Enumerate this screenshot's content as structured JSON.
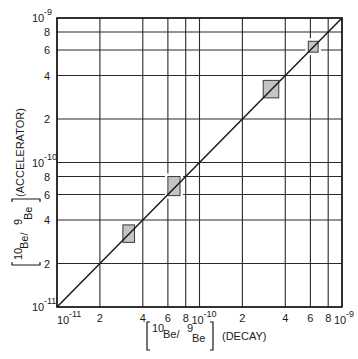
{
  "chart_data": {
    "type": "scatter",
    "title": "",
    "xlabel": "[10Be/9Be] (DECAY)",
    "ylabel": "[10Be/9Be] (ACCELERATOR)",
    "x_scale": "log",
    "y_scale": "log",
    "xlim": [
      1e-11,
      1e-09
    ],
    "ylim": [
      1e-11,
      1e-09
    ],
    "grid": true,
    "legend": null,
    "x_ticks": [
      {
        "value": 1e-11,
        "label": "10",
        "exp": "-11",
        "major": true
      },
      {
        "value": 2e-11,
        "label": "2"
      },
      {
        "value": 4e-11,
        "label": "4"
      },
      {
        "value": 6e-11,
        "label": "6"
      },
      {
        "value": 8e-11,
        "label": "8"
      },
      {
        "value": 1e-10,
        "label": "10",
        "exp": "-10",
        "major": true
      },
      {
        "value": 2e-10,
        "label": "2"
      },
      {
        "value": 4e-10,
        "label": "4"
      },
      {
        "value": 6e-10,
        "label": "6"
      },
      {
        "value": 8e-10,
        "label": "8"
      },
      {
        "value": 1e-09,
        "label": "10",
        "exp": "-9",
        "major": true
      }
    ],
    "y_ticks": [
      {
        "value": 1e-11,
        "label": "10",
        "exp": "-11",
        "major": true
      },
      {
        "value": 2e-11,
        "label": "2"
      },
      {
        "value": 4e-11,
        "label": "4"
      },
      {
        "value": 6e-11,
        "label": "6"
      },
      {
        "value": 8e-11,
        "label": "8"
      },
      {
        "value": 1e-10,
        "label": "10",
        "exp": "-10",
        "major": true
      },
      {
        "value": 2e-10,
        "label": "2"
      },
      {
        "value": 4e-10,
        "label": "4"
      },
      {
        "value": 6e-10,
        "label": "6"
      },
      {
        "value": 8e-10,
        "label": "8"
      },
      {
        "value": 1e-09,
        "label": "10",
        "exp": "-9",
        "major": true
      }
    ],
    "series": [
      {
        "name": "Measured ratios (error boxes)",
        "marker": "shaded-rectangle",
        "points": [
          {
            "x": 3.2e-11,
            "y": 3.2e-11,
            "x_err": [
              2.9e-11,
              3.5e-11
            ],
            "y_err": [
              2.8e-11,
              3.7e-11
            ]
          },
          {
            "x": 6.6e-11,
            "y": 6.9e-11,
            "x_err": [
              6e-11,
              7.3e-11
            ],
            "y_err": [
              5.9e-11,
              8e-11
            ]
          },
          {
            "x": 3.2e-10,
            "y": 3.2e-10,
            "x_err": [
              2.8e-10,
              3.6e-10
            ],
            "y_err": [
              2.8e-10,
              3.7e-10
            ]
          },
          {
            "x": 6.3e-10,
            "y": 6.3e-10,
            "x_err": [
              5.8e-10,
              6.8e-10
            ],
            "y_err": [
              5.8e-10,
              6.9e-10
            ]
          }
        ]
      },
      {
        "name": "y = x (1:1 line)",
        "type": "line",
        "x": [
          1e-11,
          1e-09
        ],
        "y": [
          1e-11,
          1e-09
        ]
      }
    ]
  },
  "axes": {
    "x_title_main": "Be/",
    "x_title_sup1": "10",
    "x_title_sup2": "9",
    "x_title_sub": "Be",
    "x_title_suffix": "(DECAY)",
    "y_title_main": "Be/",
    "y_title_sup1": "10",
    "y_title_sup2": "9",
    "y_title_sub": "Be",
    "y_title_suffix": "(ACCELERATOR)"
  },
  "colors": {
    "line": "#1a1a1a",
    "grid": "#2a2a2a",
    "box_fill": "#c4c4c4",
    "box_stroke": "#3a3a3a"
  }
}
